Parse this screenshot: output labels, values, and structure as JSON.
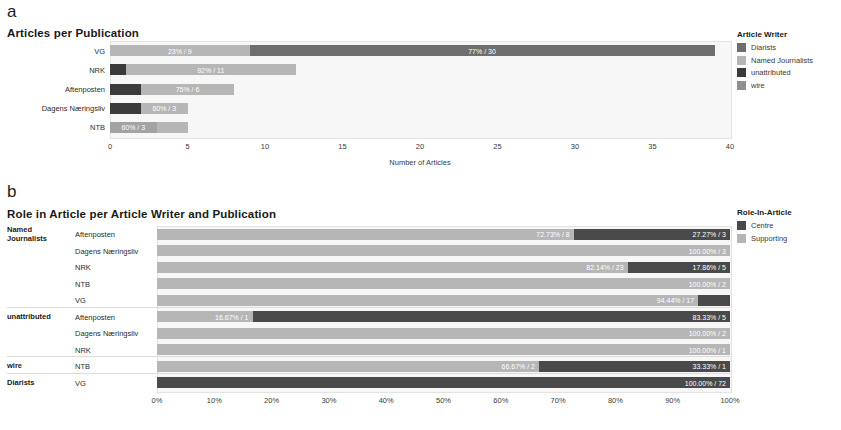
{
  "panel_a": {
    "letter": "a",
    "title": "Articles per Publication",
    "xlabel": "Number of Articles",
    "legend": {
      "title": "Article Writer",
      "items": [
        {
          "label": "Diarists",
          "color": "#6e6e6e"
        },
        {
          "label": "Named Journalists",
          "color": "#b6b6b6"
        },
        {
          "label": "unattributed",
          "color": "#3b3b3b"
        },
        {
          "label": "wire",
          "color": "#8f8f8f"
        }
      ]
    },
    "categories": [
      "VG",
      "NRK",
      "Aftenposten",
      "Dagens Næringsliv",
      "NTB"
    ],
    "ticks": [
      "0",
      "5",
      "10",
      "15",
      "20",
      "25",
      "30",
      "35",
      "40"
    ]
  },
  "panel_b": {
    "letter": "b",
    "title": "Role in Article per Article Writer and Publication",
    "legend": {
      "title": "Role-In-Article",
      "items": [
        {
          "label": "Centre",
          "color": "#4a4a4a"
        },
        {
          "label": "Supporting",
          "color": "#b6b6b6"
        }
      ]
    },
    "groups": [
      "Named Journalists",
      "unattributed",
      "wire",
      "Diarists"
    ],
    "publications": [
      "Aftenposten",
      "Dagens Næringsliv",
      "NRK",
      "NTB",
      "VG"
    ],
    "ticks": [
      "0%",
      "10%",
      "20%",
      "30%",
      "40%",
      "50%",
      "60%",
      "70%",
      "80%",
      "90%",
      "100%"
    ]
  },
  "chart_data": [
    {
      "type": "bar",
      "id": "panel-a",
      "orientation": "horizontal",
      "stacked": true,
      "title": "Articles per Publication",
      "xlabel": "Number of Articles",
      "ylabel": "",
      "xlim": [
        0,
        40
      ],
      "xticks": [
        0,
        5,
        10,
        15,
        20,
        25,
        30,
        35,
        40
      ],
      "grid": false,
      "legend_title": "Article Writer",
      "legend_position": "right",
      "categories": [
        "VG",
        "NRK",
        "Aftenposten",
        "Dagens Næringsliv",
        "NTB"
      ],
      "series": [
        {
          "name": "Diarists",
          "color": "#6e6e6e",
          "values": [
            0,
            0,
            0,
            0,
            0
          ]
        },
        {
          "name": "Named Journalists",
          "color": "#b6b6b6",
          "values": [
            9,
            11,
            6,
            3,
            3
          ]
        },
        {
          "name": "unattributed",
          "color": "#3b3b3b",
          "values": [
            0,
            1,
            2,
            2,
            0
          ]
        },
        {
          "name": "wire",
          "color": "#8f8f8f",
          "values": [
            30,
            0,
            0,
            0,
            2
          ]
        }
      ],
      "bar_rows": [
        {
          "category": "VG",
          "total": 39,
          "segments": [
            {
              "series": "Named Journalists",
              "value": 9,
              "pct": 23,
              "label": "23% / 9",
              "color": "#b6b6b6"
            },
            {
              "series": "wire",
              "value": 30,
              "pct": 77,
              "label": "77% / 30",
              "color": "#6e6e6e"
            }
          ]
        },
        {
          "category": "NRK",
          "total": 12,
          "segments": [
            {
              "series": "unattributed",
              "value": 1,
              "pct": 8,
              "label": "",
              "color": "#3b3b3b"
            },
            {
              "series": "Named Journalists",
              "value": 11,
              "pct": 92,
              "label": "92% / 11",
              "color": "#b6b6b6"
            }
          ]
        },
        {
          "category": "Aftenposten",
          "total": 8,
          "segments": [
            {
              "series": "unattributed",
              "value": 2,
              "pct": 25,
              "label": "",
              "color": "#3b3b3b"
            },
            {
              "series": "Named Journalists",
              "value": 6,
              "pct": 75,
              "label": "75% / 6",
              "color": "#b6b6b6"
            }
          ]
        },
        {
          "category": "Dagens Næringsliv",
          "total": 5,
          "segments": [
            {
              "series": "unattributed",
              "value": 2,
              "pct": 40,
              "label": "",
              "color": "#3b3b3b"
            },
            {
              "series": "Named Journalists",
              "value": 3,
              "pct": 60,
              "label": "60% / 3",
              "color": "#b6b6b6"
            }
          ]
        },
        {
          "category": "NTB",
          "total": 5,
          "segments": [
            {
              "series": "Named Journalists",
              "value": 3,
              "pct": 60,
              "label": "60% / 3",
              "color": "#a3a3a3"
            },
            {
              "series": "wire",
              "value": 2,
              "pct": 40,
              "label": "",
              "color": "#b6b6b6"
            }
          ]
        }
      ]
    },
    {
      "type": "bar",
      "id": "panel-b",
      "orientation": "horizontal",
      "stacked": true,
      "normalized": true,
      "title": "Role in Article per Article Writer and Publication",
      "xlabel": "",
      "ylabel": "",
      "xlim": [
        0,
        100
      ],
      "xticks": [
        0,
        10,
        20,
        30,
        40,
        50,
        60,
        70,
        80,
        90,
        100
      ],
      "grid": false,
      "legend_title": "Role-In-Article",
      "legend_position": "right",
      "series": [
        {
          "name": "Centre",
          "color": "#4a4a4a"
        },
        {
          "name": "Supporting",
          "color": "#b6b6b6"
        }
      ],
      "bar_rows": [
        {
          "group": "Named Journalists",
          "publication": "Aftenposten",
          "segments": [
            {
              "series": "Supporting",
              "pct": 72.73,
              "count": 8,
              "label": "72.73% / 8",
              "color": "#b6b6b6"
            },
            {
              "series": "Centre",
              "pct": 27.27,
              "count": 3,
              "label": "27.27% / 3",
              "color": "#4a4a4a"
            }
          ]
        },
        {
          "group": "Named Journalists",
          "publication": "Dagens Næringsliv",
          "segments": [
            {
              "series": "Supporting",
              "pct": 100.0,
              "count": 3,
              "label": "100.00% / 3",
              "color": "#b6b6b6"
            }
          ]
        },
        {
          "group": "Named Journalists",
          "publication": "NRK",
          "segments": [
            {
              "series": "Supporting",
              "pct": 82.14,
              "count": 23,
              "label": "82.14% / 23",
              "color": "#b6b6b6"
            },
            {
              "series": "Centre",
              "pct": 17.86,
              "count": 5,
              "label": "17.86% / 5",
              "color": "#4a4a4a"
            }
          ]
        },
        {
          "group": "Named Journalists",
          "publication": "NTB",
          "segments": [
            {
              "series": "Supporting",
              "pct": 100.0,
              "count": 2,
              "label": "100.00% / 2",
              "color": "#b6b6b6"
            }
          ]
        },
        {
          "group": "Named Journalists",
          "publication": "VG",
          "segments": [
            {
              "series": "Supporting",
              "pct": 94.44,
              "count": 17,
              "label": "94.44% / 17",
              "color": "#b6b6b6"
            },
            {
              "series": "Centre",
              "pct": 5.56,
              "count": 1,
              "label": "",
              "color": "#4a4a4a"
            }
          ]
        },
        {
          "group": "unattributed",
          "publication": "Aftenposten",
          "segments": [
            {
              "series": "Supporting",
              "pct": 16.67,
              "count": 1,
              "label": "16.67% / 1",
              "color": "#b6b6b6"
            },
            {
              "series": "Centre",
              "pct": 83.33,
              "count": 5,
              "label": "83.33% / 5",
              "color": "#4a4a4a"
            }
          ]
        },
        {
          "group": "unattributed",
          "publication": "Dagens Næringsliv",
          "segments": [
            {
              "series": "Supporting",
              "pct": 100.0,
              "count": 2,
              "label": "100.00% / 2",
              "color": "#b6b6b6"
            }
          ]
        },
        {
          "group": "unattributed",
          "publication": "NRK",
          "segments": [
            {
              "series": "Supporting",
              "pct": 100.0,
              "count": 1,
              "label": "100.00% / 1",
              "color": "#b6b6b6"
            }
          ]
        },
        {
          "group": "wire",
          "publication": "NTB",
          "segments": [
            {
              "series": "Supporting",
              "pct": 66.67,
              "count": 2,
              "label": "66.67% / 2",
              "color": "#b6b6b6"
            },
            {
              "series": "Centre",
              "pct": 33.33,
              "count": 1,
              "label": "33.33% / 1",
              "color": "#4a4a4a"
            }
          ]
        },
        {
          "group": "Diarists",
          "publication": "VG",
          "segments": [
            {
              "series": "Centre",
              "pct": 100.0,
              "count": 72,
              "label": "100.00% / 72",
              "color": "#4a4a4a"
            }
          ]
        }
      ]
    }
  ]
}
